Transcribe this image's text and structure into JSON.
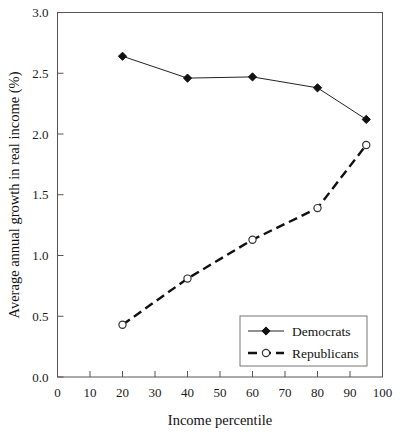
{
  "chart_data": {
    "type": "line",
    "title": "",
    "subtitle": "",
    "xlabel": "Income percentile",
    "ylabel": "Average annual growth in real income (%)",
    "xlim": [
      0,
      100
    ],
    "ylim": [
      0.0,
      3.0
    ],
    "xticks": [
      0,
      10,
      20,
      30,
      40,
      50,
      60,
      70,
      80,
      90,
      100
    ],
    "xticklabels": [
      "0",
      "10",
      "20",
      "30",
      "40",
      "50",
      "60",
      "70",
      "80",
      "90",
      "100"
    ],
    "yticks": [
      0.0,
      0.5,
      1.0,
      1.5,
      2.0,
      2.5,
      3.0
    ],
    "yticklabels": [
      "0.0",
      "0.5",
      "1.0",
      "1.5",
      "2.0",
      "2.5",
      "3.0"
    ],
    "grid": false,
    "legend_position": "lower right inside plot",
    "series": [
      {
        "name": "Democrats",
        "linestyle": "solid",
        "marker": "filled-diamond",
        "color": "#111111",
        "x": [
          20,
          40,
          60,
          80,
          95
        ],
        "values": [
          2.64,
          2.46,
          2.47,
          2.38,
          2.12
        ]
      },
      {
        "name": "Republicans",
        "linestyle": "dashed",
        "marker": "open-circle",
        "color": "#111111",
        "x": [
          20,
          40,
          60,
          80,
          95
        ],
        "values": [
          0.43,
          0.81,
          1.13,
          1.39,
          1.91
        ]
      }
    ]
  },
  "legend": {
    "entries": [
      {
        "label": "Democrats"
      },
      {
        "label": "Republicans"
      }
    ]
  },
  "axes": {
    "x_title": "Income percentile",
    "y_title": "Average annual growth in real income (%)"
  }
}
